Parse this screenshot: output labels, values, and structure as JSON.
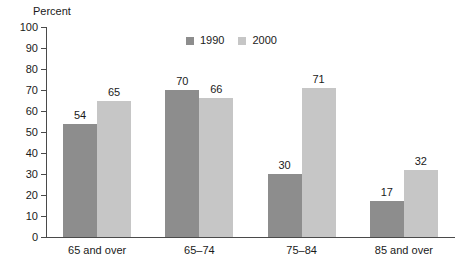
{
  "chart_data": {
    "type": "bar",
    "title": "",
    "subtitle": "",
    "xlabel": "",
    "ylabel": "Percent",
    "ylim": [
      0,
      100
    ],
    "ytick_step": 10,
    "yticks": [
      "100",
      "90",
      "80",
      "70",
      "60",
      "50",
      "40",
      "30",
      "20",
      "10",
      "0"
    ],
    "grid": false,
    "legend_position": "top-center",
    "categories": [
      "65 and over",
      "65–74",
      "75–84",
      "85 and over"
    ],
    "series": [
      {
        "name": "1990",
        "color": "#8d8d8d",
        "values": [
          54,
          70,
          30,
          17
        ]
      },
      {
        "name": "2000",
        "color": "#c6c6c6",
        "values": [
          65,
          66,
          71,
          32
        ]
      }
    ],
    "value_labels": [
      [
        "54",
        "65"
      ],
      [
        "70",
        "66"
      ],
      [
        "30",
        "71"
      ],
      [
        "17",
        "32"
      ]
    ]
  },
  "legend": {
    "items": [
      {
        "label": "1990",
        "color": "#8d8d8d"
      },
      {
        "label": "2000",
        "color": "#c6c6c6"
      }
    ]
  },
  "axis": {
    "y_title": "Percent"
  },
  "colors": {
    "series_1990": "#8d8d8d",
    "series_2000": "#c6c6c6",
    "axis": "#4a4a4a",
    "text": "#1a1a1a",
    "background": "#ffffff"
  }
}
